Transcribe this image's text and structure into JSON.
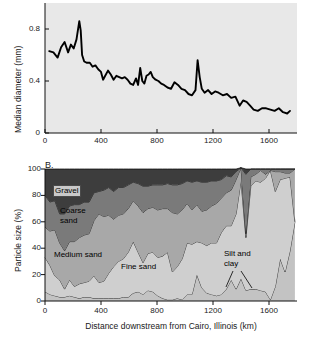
{
  "figure": {
    "panel_a_letter": "",
    "panel_b_letter": "B."
  },
  "chart_data": [
    {
      "id": "panel_a",
      "type": "line",
      "title": "",
      "panel_label": "",
      "xlabel": "",
      "ylabel": "Median diameter (mm)",
      "xlim": [
        0,
        1800
      ],
      "ylim": [
        0,
        1.0
      ],
      "xticks": [
        0,
        400,
        800,
        1200,
        1600
      ],
      "xticklabels": [
        "0",
        "400",
        "800",
        "1200",
        "1600"
      ],
      "yticks": [
        0,
        0.4,
        0.8
      ],
      "yticklabels": [
        "0",
        "0.4",
        "0.8"
      ],
      "grid": false,
      "legend": "none",
      "line_color": "#000000",
      "series": [
        {
          "name": "Median diameter",
          "x": [
            30,
            60,
            90,
            115,
            140,
            165,
            185,
            205,
            225,
            245,
            255,
            265,
            280,
            300,
            320,
            340,
            360,
            380,
            400,
            415,
            430,
            450,
            470,
            490,
            510,
            530,
            550,
            570,
            590,
            610,
            630,
            650,
            665,
            680,
            695,
            710,
            725,
            740,
            755,
            770,
            790,
            810,
            830,
            850,
            875,
            900,
            925,
            950,
            975,
            1000,
            1025,
            1050,
            1075,
            1090,
            1105,
            1120,
            1140,
            1165,
            1190,
            1215,
            1240,
            1270,
            1300,
            1330,
            1360,
            1390,
            1415,
            1440,
            1465,
            1490,
            1520,
            1550,
            1580,
            1610,
            1640,
            1670,
            1700,
            1730,
            1750
          ],
          "y": [
            0.63,
            0.62,
            0.58,
            0.66,
            0.7,
            0.62,
            0.68,
            0.65,
            0.72,
            0.86,
            0.79,
            0.6,
            0.55,
            0.54,
            0.54,
            0.51,
            0.52,
            0.49,
            0.47,
            0.41,
            0.44,
            0.48,
            0.45,
            0.41,
            0.44,
            0.43,
            0.42,
            0.43,
            0.41,
            0.38,
            0.37,
            0.42,
            0.37,
            0.5,
            0.4,
            0.38,
            0.44,
            0.45,
            0.47,
            0.43,
            0.41,
            0.4,
            0.38,
            0.37,
            0.35,
            0.34,
            0.39,
            0.37,
            0.34,
            0.33,
            0.3,
            0.29,
            0.33,
            0.56,
            0.43,
            0.34,
            0.31,
            0.33,
            0.3,
            0.32,
            0.31,
            0.29,
            0.3,
            0.27,
            0.28,
            0.21,
            0.25,
            0.24,
            0.21,
            0.18,
            0.17,
            0.19,
            0.19,
            0.18,
            0.17,
            0.19,
            0.16,
            0.15,
            0.17,
            0.11
          ]
        }
      ]
    },
    {
      "id": "panel_b",
      "type": "area",
      "stacked": true,
      "panel_label": "B.",
      "title": "",
      "xlabel": "Distance downstream from Cairo, Illinois (km)",
      "ylabel": "Particle size (%)",
      "xlim": [
        0,
        1800
      ],
      "ylim": [
        0,
        100
      ],
      "xticks": [
        0,
        400,
        800,
        1200,
        1600
      ],
      "xticklabels": [
        "0",
        "400",
        "800",
        "1200",
        "1600"
      ],
      "yticks": [
        0,
        20,
        40,
        60,
        80,
        100
      ],
      "yticklabels": [
        "0",
        "20",
        "40",
        "60",
        "80",
        "100"
      ],
      "grid": false,
      "legend": "in-plot-annotations",
      "annotations": [
        {
          "text": "Gravel",
          "boxed": true
        },
        {
          "text": "Coarse\nsand",
          "boxed": false
        },
        {
          "text": "Medium sand",
          "boxed": false
        },
        {
          "text": "Fine sand",
          "boxed": false
        },
        {
          "text": "Silt and\nclay",
          "boxed": false
        }
      ],
      "x": [
        0,
        35,
        70,
        105,
        140,
        175,
        210,
        245,
        280,
        315,
        350,
        385,
        420,
        455,
        490,
        525,
        560,
        595,
        630,
        665,
        700,
        735,
        770,
        805,
        840,
        875,
        910,
        945,
        980,
        1015,
        1050,
        1085,
        1120,
        1155,
        1190,
        1225,
        1260,
        1295,
        1330,
        1365,
        1400,
        1435,
        1470,
        1505,
        1540,
        1575,
        1610,
        1645,
        1680,
        1715,
        1750,
        1785
      ],
      "series": [
        {
          "name": "Silt and clay",
          "color": "#c3c3c3",
          "values": [
            7,
            5,
            4,
            3,
            3,
            4,
            3,
            2,
            3,
            3,
            2,
            2,
            2,
            2,
            2,
            2,
            3,
            3,
            6,
            7,
            5,
            8,
            7,
            4,
            2,
            1,
            1,
            2,
            1,
            5,
            5,
            20,
            10,
            6,
            5,
            4,
            5,
            9,
            16,
            9,
            17,
            8,
            9,
            9,
            8,
            7,
            1,
            11,
            32,
            22,
            38,
            60
          ]
        },
        {
          "name": "Fine sand",
          "color": "#cfcfcf",
          "values": [
            26,
            22,
            15,
            13,
            6,
            12,
            8,
            11,
            11,
            12,
            17,
            12,
            13,
            19,
            24,
            28,
            29,
            34,
            39,
            30,
            24,
            28,
            30,
            29,
            32,
            36,
            21,
            24,
            31,
            39,
            38,
            25,
            34,
            36,
            39,
            40,
            47,
            48,
            41,
            57,
            74,
            40,
            78,
            82,
            82,
            86,
            98,
            72,
            60,
            71,
            56,
            0
          ]
        },
        {
          "name": "Medium sand",
          "color": "#a8a8a8",
          "values": [
            23,
            26,
            35,
            28,
            29,
            29,
            34,
            35,
            36,
            36,
            42,
            52,
            49,
            44,
            36,
            35,
            34,
            33,
            31,
            35,
            38,
            34,
            34,
            36,
            36,
            33,
            45,
            40,
            37,
            30,
            26,
            28,
            24,
            27,
            28,
            30,
            26,
            25,
            27,
            26,
            10,
            3,
            7,
            5,
            9,
            3,
            0,
            15,
            6,
            4,
            3,
            40
          ]
        },
        {
          "name": "Coarse sand",
          "color": "#7a7a7a",
          "values": [
            24,
            22,
            22,
            22,
            28,
            27,
            28,
            25,
            25,
            24,
            21,
            17,
            20,
            21,
            21,
            21,
            20,
            18,
            14,
            17,
            20,
            17,
            17,
            19,
            18,
            19,
            21,
            22,
            20,
            17,
            21,
            18,
            22,
            21,
            19,
            17,
            14,
            13,
            10,
            6,
            0,
            45,
            6,
            4,
            1,
            4,
            1,
            2,
            2,
            3,
            3,
            0
          ]
        },
        {
          "name": "Gravel",
          "color": "#3d3d3d",
          "values": [
            20,
            25,
            24,
            34,
            34,
            28,
            27,
            27,
            25,
            25,
            18,
            17,
            16,
            14,
            17,
            14,
            14,
            12,
            10,
            11,
            13,
            13,
            12,
            12,
            12,
            11,
            12,
            12,
            11,
            9,
            10,
            9,
            10,
            10,
            9,
            9,
            8,
            5,
            6,
            2,
            0,
            4,
            0,
            0,
            0,
            0,
            0,
            0,
            0,
            0,
            0,
            0
          ]
        }
      ]
    }
  ]
}
